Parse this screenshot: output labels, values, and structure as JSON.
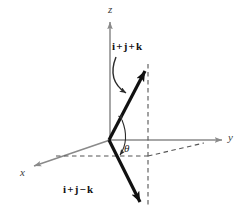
{
  "figure": {
    "axis_color": "#8a8a8a",
    "vector_color": "#111111",
    "dashed_color": "#555555",
    "background": "#ffffff"
  },
  "axes": {
    "z": {
      "label": "z",
      "direction": "up"
    },
    "y": {
      "label": "y",
      "direction": "right"
    },
    "x": {
      "label": "x",
      "direction": "down-left"
    }
  },
  "vectors": [
    {
      "id": "v-top",
      "label_parts": {
        "i": "i",
        "plus1": "+",
        "j": "j",
        "plus2": "+",
        "k": "k"
      },
      "label": "i + j + k",
      "components": [
        1,
        1,
        1
      ]
    },
    {
      "id": "v-bottom",
      "label_parts": {
        "i": "i",
        "plus1": "+",
        "j": "j",
        "minus": "−",
        "k": "k"
      },
      "label": "i + j − k",
      "components": [
        1,
        1,
        -1
      ]
    }
  ],
  "angle": {
    "symbol": "θ",
    "name": "theta",
    "between": [
      "i + j + k",
      "i + j − k"
    ]
  },
  "annotations": {
    "leader_arrow": "curved-pointer-from-top-label-to-vector"
  }
}
